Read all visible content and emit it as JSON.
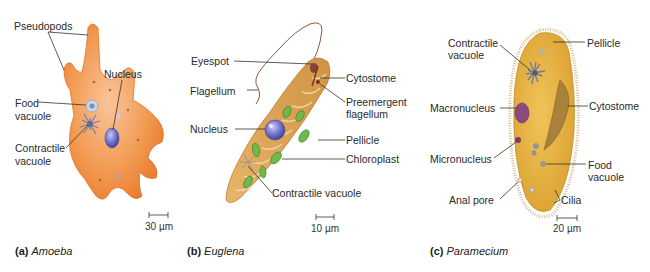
{
  "figure": {
    "panels": [
      {
        "id": "a",
        "letter": "(a)",
        "organism": "Amoeba",
        "scale_bar": "30 µm",
        "labels": [
          "Pseudopods",
          "Nucleus",
          "Food",
          "vacuole",
          "Contractile",
          "vacuole"
        ]
      },
      {
        "id": "b",
        "letter": "(b)",
        "organism": "Euglena",
        "scale_bar": "10 µm",
        "labels": [
          "Eyespot",
          "Flagellum",
          "Nucleus",
          "Cytostome",
          "Preemergent",
          "flagellum",
          "Pellicle",
          "Chloroplast",
          "Contractile vacuole"
        ]
      },
      {
        "id": "c",
        "letter": "(c)",
        "organism": "Paramecium",
        "scale_bar": "20 µm",
        "labels": [
          "Contractile",
          "vacuole",
          "Pellicle",
          "Macronucleus",
          "Cytostome",
          "Micronucleus",
          "Food",
          "vacuole",
          "Anal pore",
          "Cilia"
        ]
      }
    ],
    "colors": {
      "amoeba_body": "#f08a3c",
      "amoeba_light": "#f7b27a",
      "euglena_body": "#dca055",
      "euglena_ridge": "#f3cf8e",
      "chloroplast": "#6fb84a",
      "nucleus_blue": "#6a6ac8",
      "paramecium_body": "#e6b23c",
      "macronucleus": "#8a4a80",
      "leader_line": "#333333"
    }
  }
}
